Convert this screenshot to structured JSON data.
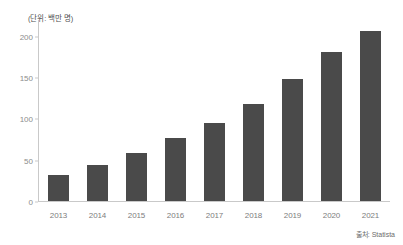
{
  "unit_caption": "(단위: 백만 명)",
  "source": {
    "label": "출처: Statista"
  },
  "chart_data": {
    "type": "bar",
    "title": "",
    "subtitle": "",
    "xlabel": "",
    "ylabel": "(단위: 백만 명)",
    "categories": [
      "2013",
      "2014",
      "2015",
      "2016",
      "2017",
      "2018",
      "2019",
      "2020",
      "2021"
    ],
    "values": [
      32,
      44,
      58,
      77,
      95,
      118,
      148,
      181,
      207
    ],
    "series": [
      {
        "name": "사용자 수",
        "values": [
          32,
          44,
          58,
          77,
          95,
          118,
          148,
          181,
          207
        ]
      }
    ],
    "ylim": [
      0,
      220
    ],
    "yticks": [
      0,
      50,
      100,
      150,
      200
    ],
    "ytick_labels": [
      "0",
      "50",
      "100",
      "150",
      "200"
    ],
    "grid": false,
    "legend": false,
    "bar_color": "#4a4a4a",
    "axis_color": "#c9c9c9",
    "tick_label_color": "#8c8c8c"
  }
}
